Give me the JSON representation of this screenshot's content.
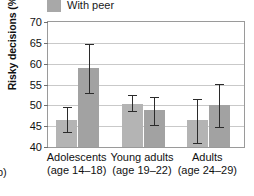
{
  "panel_label": "b)",
  "legend": {
    "items": [
      {
        "label": "With peer",
        "color": "#a8a8a8",
        "icon": "square-swatch"
      }
    ]
  },
  "axes": {
    "ylabel": "Risky decisions (%)",
    "yticks": [
      "40",
      "45",
      "50",
      "55",
      "60",
      "65",
      "70"
    ],
    "ymin": 40,
    "ymax": 70,
    "xlabel": ""
  },
  "groups": [
    {
      "line1": "Adolescents",
      "line2": "(age 14–18)"
    },
    {
      "line1": "Young adults",
      "line2": "(age 19–22)"
    },
    {
      "line1": "Adults",
      "line2": "(age 24–29)"
    }
  ],
  "chart_data": {
    "type": "bar",
    "title": "",
    "xlabel": "",
    "ylabel": "Risky decisions (%)",
    "ylim": [
      40,
      70
    ],
    "ytick_values": [
      40,
      45,
      50,
      55,
      60,
      65,
      70
    ],
    "grid": true,
    "legend_position": "above-plot-left",
    "categories": [
      "Adolescents (age 14–18)",
      "Young adults (age 19–22)",
      "Adults (age 24–29)"
    ],
    "series": [
      {
        "name": "Alone",
        "color": "#b4b4b4",
        "values": [
          46.5,
          50.3,
          46.5
        ],
        "error_low": [
          43.5,
          48.7,
          41.0
        ],
        "error_high": [
          49.6,
          52.4,
          51.5
        ]
      },
      {
        "name": "With peer",
        "color": "#a2a2a2",
        "values": [
          58.9,
          48.8,
          50.0
        ],
        "error_low": [
          53.0,
          45.4,
          44.7
        ],
        "error_high": [
          64.8,
          52.0,
          55.2
        ]
      }
    ]
  }
}
